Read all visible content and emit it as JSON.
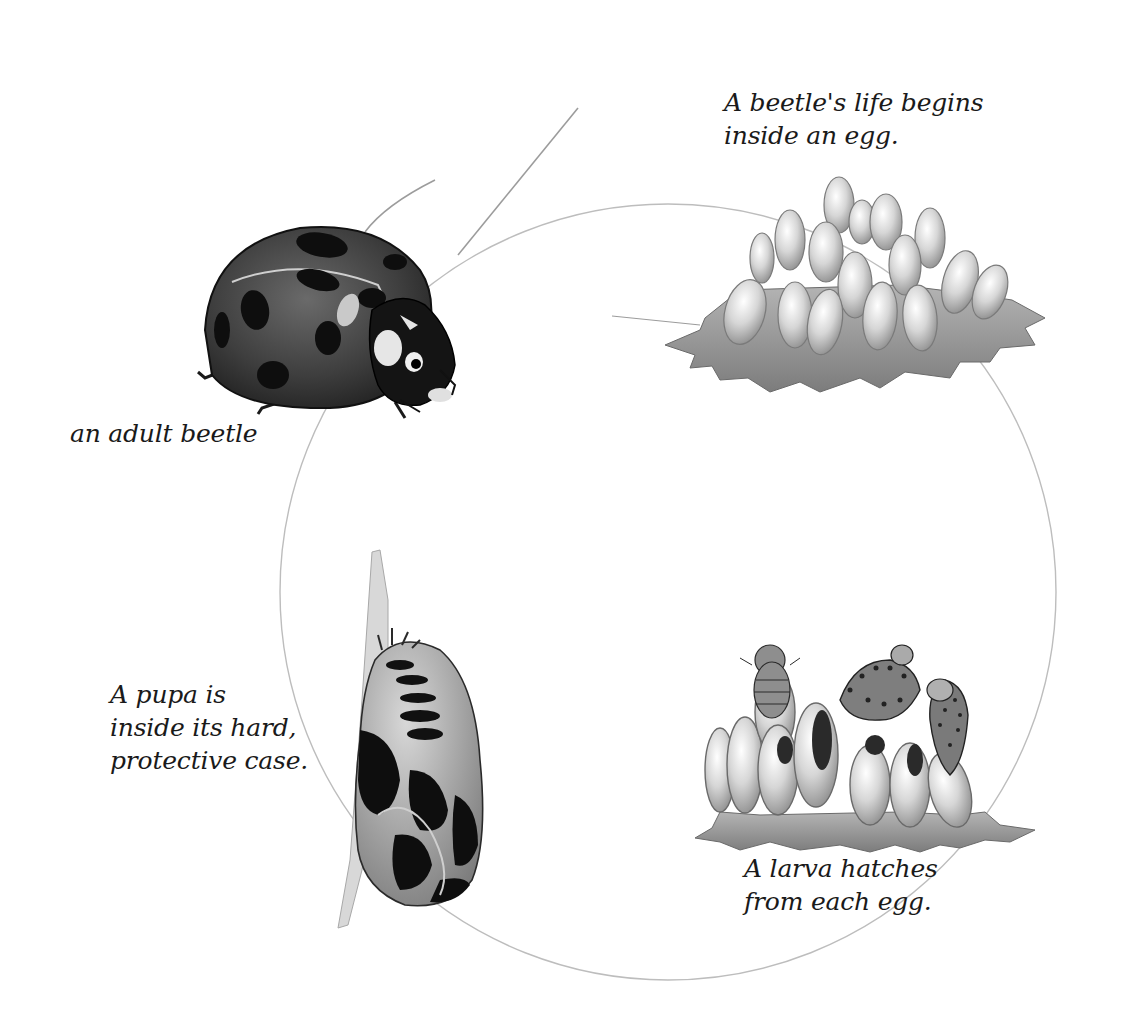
{
  "stages": [
    {
      "id": "egg",
      "label_lines": [
        "A beetle's life begins",
        "inside an egg."
      ],
      "illustration": "egg-cluster-on-leaf"
    },
    {
      "id": "larva",
      "label_lines": [
        "A larva hatches",
        "from each egg."
      ],
      "illustration": "larvae-hatching-from-eggs"
    },
    {
      "id": "pupa",
      "label_lines": [
        "A pupa is",
        "inside its hard,",
        "protective case."
      ],
      "illustration": "pupa-on-stem"
    },
    {
      "id": "adult",
      "label_lines": [
        "an adult beetle"
      ],
      "illustration": "adult-ladybird-beetle"
    }
  ],
  "colors": {
    "background": "#ffffff",
    "text": "#1a1a1a",
    "cycle_line": "#b8b8b8",
    "beetle_shell": "#3c3c3c",
    "beetle_spots": "#111111",
    "egg": "#dcdcdc",
    "leaf": "#9a9a9a"
  }
}
